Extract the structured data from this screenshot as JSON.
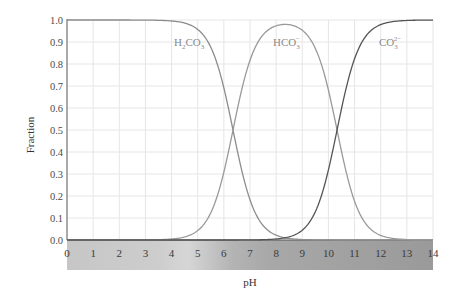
{
  "chart_data": {
    "type": "line",
    "title": "",
    "xlabel": "pH",
    "ylabel": "Fraction",
    "xlim": [
      0,
      14
    ],
    "ylim": [
      0.0,
      1.0
    ],
    "x_ticks": [
      "0",
      "1",
      "2",
      "3",
      "4",
      "5",
      "6",
      "7",
      "8",
      "9",
      "10",
      "11",
      "12",
      "13",
      "14"
    ],
    "y_ticks": [
      "0.0",
      "0.1",
      "0.2",
      "0.3",
      "0.4",
      "0.5",
      "0.6",
      "0.7",
      "0.8",
      "0.9",
      "1.0"
    ],
    "grid": true,
    "legend": "inline labels",
    "pKa": [
      6.35,
      10.33
    ],
    "x": [
      0,
      1,
      2,
      3,
      4,
      5,
      6,
      6.35,
      7,
      8,
      8.34,
      9,
      10,
      10.33,
      11,
      12,
      13,
      14
    ],
    "series": [
      {
        "name": "H2CO3",
        "label_main": "H",
        "label_sub": "2",
        "label_main2": "CO",
        "label_sub2": "3",
        "label_sup": "",
        "color": "#8c8c8c",
        "values": [
          1.0,
          1.0,
          1.0,
          1.0,
          1.0,
          0.96,
          0.69,
          0.5,
          0.18,
          0.02,
          0.01,
          0.0,
          0.0,
          0.0,
          0.0,
          0.0,
          0.0,
          0.0
        ]
      },
      {
        "name": "HCO3-",
        "label_main": "HCO",
        "label_sub": "3",
        "label_sup": "−",
        "color": "#999999",
        "values": [
          0.0,
          0.0,
          0.0,
          0.0,
          0.0,
          0.04,
          0.31,
          0.5,
          0.82,
          0.98,
          0.98,
          0.96,
          0.68,
          0.5,
          0.18,
          0.02,
          0.0,
          0.0
        ]
      },
      {
        "name": "CO3 2-",
        "label_main": "CO",
        "label_sub": "3",
        "label_sup": "2−",
        "color": "#555555",
        "values": [
          0.0,
          0.0,
          0.0,
          0.0,
          0.0,
          0.0,
          0.0,
          0.0,
          0.0,
          0.0,
          0.01,
          0.04,
          0.32,
          0.5,
          0.82,
          0.98,
          1.0,
          1.0
        ]
      }
    ],
    "annotations": [
      "H2CO3",
      "HCO3-",
      "CO3 2-"
    ],
    "ph_bar": {
      "gradient": "gray, lighter around pH 4-5, darker toward pH 7-14"
    }
  }
}
